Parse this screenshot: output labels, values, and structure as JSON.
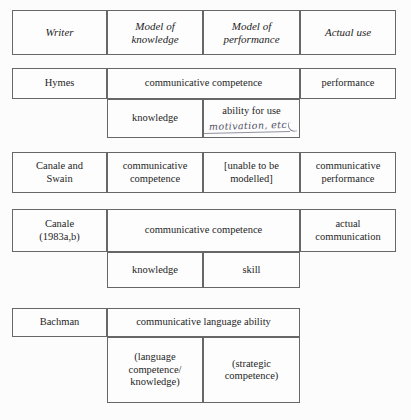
{
  "figure": {
    "kind": "comparison-table",
    "columns": [
      {
        "key": "writer",
        "label": "Writer"
      },
      {
        "key": "knowledge",
        "label": "Model of\nknowledge"
      },
      {
        "key": "performance",
        "label": "Model of\nperformance"
      },
      {
        "key": "actual_use",
        "label": "Actual use"
      }
    ],
    "rows": [
      {
        "writer": "Hymes",
        "span_label": "communicative competence",
        "actual_use": "performance",
        "sub": [
          {
            "label": "knowledge"
          },
          {
            "label": "ability for use",
            "annotation": "motivation, etc"
          }
        ]
      },
      {
        "writer": "Canale and\nSwain",
        "knowledge": "communicative\ncompetence",
        "performance": "[unable to be\nmodelled]",
        "actual_use": "communicative\nperformance",
        "sub": []
      },
      {
        "writer": "Canale\n(1983a,b)",
        "span_label": "communicative competence",
        "actual_use": "actual\ncommunication",
        "sub": [
          {
            "label": "knowledge"
          },
          {
            "label": "skill"
          }
        ]
      },
      {
        "writer": "Bachman",
        "span_label": "communicative language ability",
        "actual_use": "",
        "sub": [
          {
            "label": "(language\ncompetence/\nknowledge)"
          },
          {
            "label": "(strategic\ncompetence)"
          }
        ]
      }
    ]
  },
  "style": {
    "border_color": "#676767",
    "page_background": "#fcfcfc",
    "text_color": "#1f1f1f",
    "handwriting_color": "#3a3a52"
  }
}
